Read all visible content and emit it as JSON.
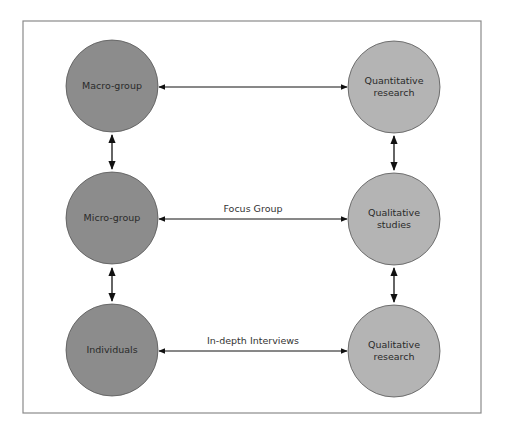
{
  "diagram": {
    "colors": {
      "frame": "#8a8a8a",
      "dark_fill": "#8c8c8c",
      "light_fill": "#b4b4b4",
      "stroke": "#555555",
      "arrow": "#111111"
    },
    "nodes": {
      "macro_group": {
        "lines": [
          "Macro-group"
        ]
      },
      "micro_group": {
        "lines": [
          "Micro-group"
        ]
      },
      "individuals": {
        "lines": [
          "Individuals"
        ]
      },
      "quantitative_research": {
        "lines": [
          "Quantitative",
          "research"
        ]
      },
      "qualitative_studies": {
        "lines": [
          "Qualitative",
          "studies"
        ]
      },
      "qualitative_research": {
        "lines": [
          "Qualitative",
          "research"
        ]
      }
    },
    "edges": {
      "macro_to_quant": {
        "label": ""
      },
      "micro_to_qual_studies": {
        "label": "Focus Group"
      },
      "individuals_to_qual_research": {
        "label": "In-depth Interviews"
      }
    }
  }
}
